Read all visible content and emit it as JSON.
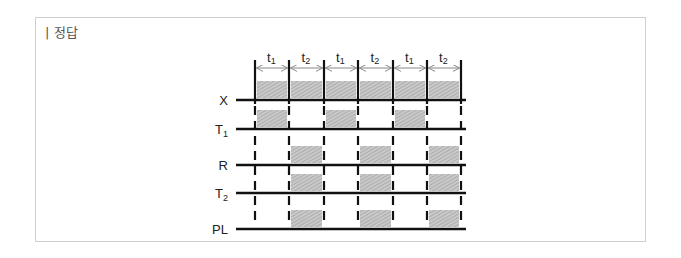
{
  "title": "| 정답",
  "chart_data": {
    "type": "timing-diagram",
    "intervals": [
      "t1",
      "t2",
      "t1",
      "t2",
      "t1",
      "t2"
    ],
    "markers_x": [
      255,
      289,
      324,
      358,
      393,
      427,
      461
    ],
    "signals": [
      {
        "name": "X",
        "sub": "",
        "y": 100,
        "high": [
          [
            0,
            1
          ],
          [
            1,
            2
          ],
          [
            2,
            3
          ],
          [
            3,
            4
          ],
          [
            4,
            5
          ],
          [
            5,
            6
          ]
        ]
      },
      {
        "name": "T",
        "sub": "1",
        "y": 129,
        "high": [
          [
            0,
            1
          ],
          [
            2,
            3
          ],
          [
            4,
            5
          ]
        ]
      },
      {
        "name": "R",
        "sub": "",
        "y": 165,
        "high": [
          [
            1,
            2
          ],
          [
            3,
            4
          ],
          [
            5,
            6
          ]
        ]
      },
      {
        "name": "T",
        "sub": "2",
        "y": 193,
        "high": [
          [
            1,
            2
          ],
          [
            3,
            4
          ],
          [
            5,
            6
          ]
        ]
      },
      {
        "name": "PL",
        "sub": "",
        "y": 229,
        "high": [
          [
            1,
            2
          ],
          [
            3,
            4
          ],
          [
            5,
            6
          ]
        ]
      }
    ]
  },
  "colors": {
    "fill": "#bdbdbd",
    "line": "#111111",
    "frame": "#cfcfcf"
  }
}
